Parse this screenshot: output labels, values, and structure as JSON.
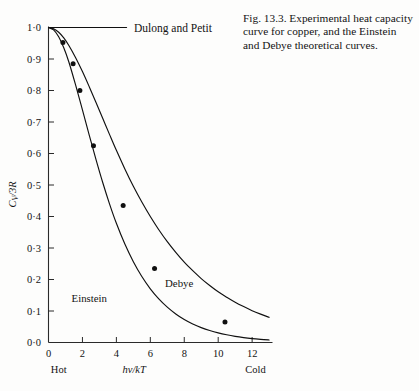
{
  "caption": {
    "text": "Fig. 13.3. Experimental heat capacity curve for copper, and the Einstein and Debye theoretical curves."
  },
  "labels": {
    "dulong_petit": "Dulong and Petit",
    "einstein": "Einstein",
    "debye": "Debye",
    "hot": "Hot",
    "cold": "Cold",
    "y_axis": "Cv/3R",
    "y_axis_main": "C",
    "y_axis_sub": "V",
    "y_axis_rest": "/3R",
    "x_axis": "hv/kT"
  },
  "colors": {
    "ink": "#131313",
    "curve": "#101010",
    "axis": "#2a2a2a",
    "background": "#fdfdfc"
  },
  "chart_data": {
    "type": "line",
    "title": "",
    "xlabel": "hv/kT",
    "ylabel": "Cv/3R",
    "xlim": [
      0,
      13.2
    ],
    "ylim": [
      0,
      1.0
    ],
    "grid": false,
    "legend": "inline-annotations",
    "xticks": [
      0,
      2,
      4,
      6,
      8,
      10,
      12
    ],
    "xtick_labels": [
      "0",
      "2",
      "4",
      "6",
      "8",
      "10",
      "12"
    ],
    "yticks": [
      0.0,
      0.1,
      0.2,
      0.3,
      0.4,
      0.5,
      0.6,
      0.7,
      0.8,
      0.9,
      1.0
    ],
    "ytick_labels": [
      "0·0",
      "0·1",
      "0·2",
      "0·3",
      "0·4",
      "0·5",
      "0·6",
      "0·7",
      "0·8",
      "0·9",
      "1·0"
    ],
    "annotations": [
      {
        "text": "Dulong and Petit",
        "x": 4.8,
        "y": 1.0
      },
      {
        "text": "Einstein",
        "x": 2.4,
        "y": 0.13
      },
      {
        "text": "Debye",
        "x": 7.7,
        "y": 0.175
      },
      {
        "text": "Hot",
        "x": 0.6,
        "y": -0.085
      },
      {
        "text": "Cold",
        "x": 12.2,
        "y": -0.085
      }
    ],
    "series": [
      {
        "name": "Dulong and Petit",
        "type": "line",
        "x": [
          0.0,
          4.6
        ],
        "values": [
          1.0,
          1.0
        ]
      },
      {
        "name": "Einstein",
        "type": "line",
        "x": [
          0.0,
          0.3,
          0.6,
          0.9,
          1.2,
          1.6,
          2.0,
          2.4,
          2.8,
          3.2,
          3.6,
          4.0,
          4.5,
          5.0,
          5.5,
          6.0,
          6.5,
          7.0,
          7.5,
          8.0,
          8.5,
          9.0,
          9.5,
          10.0,
          10.5,
          11.0,
          11.5,
          12.0,
          12.5,
          13.0
        ],
        "values": [
          1.0,
          0.9925,
          0.9705,
          0.9355,
          0.8905,
          0.817,
          0.7385,
          0.6585,
          0.5805,
          0.507,
          0.4395,
          0.3785,
          0.3125,
          0.2565,
          0.2095,
          0.1705,
          0.1385,
          0.1122,
          0.0905,
          0.0729,
          0.0587,
          0.0472,
          0.0379,
          0.0304,
          0.0244,
          0.0195,
          0.0156,
          0.0125,
          0.01,
          0.008
        ]
      },
      {
        "name": "Debye",
        "type": "line",
        "x": [
          0.0,
          0.3,
          0.6,
          0.9,
          1.2,
          1.6,
          2.0,
          2.4,
          2.8,
          3.2,
          3.6,
          4.0,
          4.5,
          5.0,
          5.5,
          6.0,
          6.5,
          7.0,
          7.5,
          8.0,
          8.5,
          9.0,
          9.5,
          10.0,
          10.5,
          11.0,
          11.5,
          12.0,
          12.5,
          13.0
        ],
        "values": [
          1.0,
          0.996,
          0.985,
          0.967,
          0.943,
          0.904,
          0.86,
          0.812,
          0.762,
          0.711,
          0.66,
          0.61,
          0.551,
          0.496,
          0.446,
          0.4,
          0.358,
          0.32,
          0.286,
          0.255,
          0.228,
          0.203,
          0.181,
          0.161,
          0.144,
          0.128,
          0.114,
          0.101,
          0.09,
          0.08
        ]
      },
      {
        "name": "Experimental (copper)",
        "type": "scatter",
        "x": [
          0.85,
          1.45,
          1.85,
          2.65,
          4.4,
          6.25,
          10.4
        ],
        "values": [
          0.952,
          0.885,
          0.8,
          0.625,
          0.435,
          0.235,
          0.065
        ]
      }
    ]
  }
}
